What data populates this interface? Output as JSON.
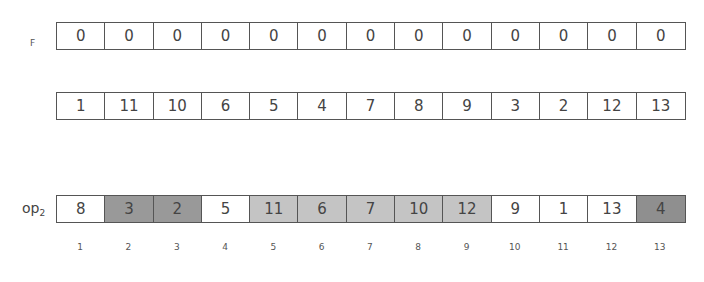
{
  "rows": {
    "f": {
      "label": "F",
      "values": [
        "0",
        "0",
        "0",
        "0",
        "0",
        "0",
        "0",
        "0",
        "0",
        "0",
        "0",
        "0",
        "0"
      ]
    },
    "perm": {
      "label": "",
      "values": [
        "1",
        "11",
        "10",
        "6",
        "5",
        "4",
        "7",
        "8",
        "9",
        "3",
        "2",
        "12",
        "13"
      ]
    },
    "op2": {
      "label": "op",
      "label_sub": "2",
      "values": [
        "8",
        "3",
        "2",
        "5",
        "11",
        "6",
        "7",
        "10",
        "12",
        "9",
        "1",
        "13",
        "4"
      ],
      "shades": [
        "white",
        "dark",
        "dark",
        "white",
        "light",
        "light",
        "light",
        "light",
        "light",
        "white",
        "white",
        "white",
        "darker"
      ]
    }
  },
  "indices": [
    "1",
    "2",
    "3",
    "4",
    "5",
    "6",
    "7",
    "8",
    "9",
    "10",
    "11",
    "12",
    "13"
  ],
  "colors": {
    "white": "#ffffff",
    "light": "#c4c4c4",
    "dark": "#999999",
    "darker": "#8f8f8f",
    "border": "#555555"
  }
}
